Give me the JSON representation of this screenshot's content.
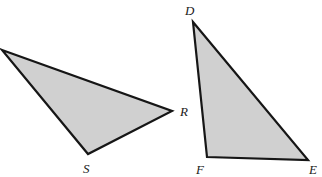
{
  "figure": {
    "background_color": "#ffffff",
    "stroke_color": "#161616",
    "fill_color": "#d0d0d0",
    "stroke_width": 2.2,
    "label_color": "#1a1a1a",
    "label_font_size": 13
  },
  "shapes": [
    {
      "name": "triangle-rs",
      "points": "2,50 172,111 88,154",
      "vertices": [
        {
          "label": "",
          "x": 2,
          "y": 50
        },
        {
          "label": "R",
          "x": 172,
          "y": 111
        },
        {
          "label": "S",
          "x": 88,
          "y": 154
        }
      ]
    },
    {
      "name": "triangle-def",
      "points": "193,22 308,160 207,157",
      "vertices": [
        {
          "label": "D",
          "x": 193,
          "y": 22
        },
        {
          "label": "E",
          "x": 308,
          "y": 160
        },
        {
          "label": "F",
          "x": 207,
          "y": 157
        }
      ]
    }
  ],
  "labels": [
    {
      "id": "R",
      "text": "R",
      "x": 180,
      "y": 116
    },
    {
      "id": "S",
      "text": "S",
      "x": 83,
      "y": 173
    },
    {
      "id": "D",
      "text": "D",
      "x": 185,
      "y": 15
    },
    {
      "id": "F",
      "text": "F",
      "x": 196,
      "y": 174
    },
    {
      "id": "E",
      "text": "E",
      "x": 309,
      "y": 174
    }
  ]
}
